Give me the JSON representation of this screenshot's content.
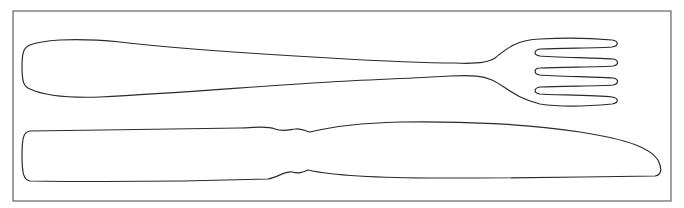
{
  "drawing": {
    "subject": "fork and knife line drawing",
    "items": [
      {
        "name": "fork",
        "tines": 4
      },
      {
        "name": "knife"
      }
    ],
    "colors": {
      "line": "#2a2a2a",
      "background": "#ffffff",
      "frame": "#444444"
    }
  }
}
